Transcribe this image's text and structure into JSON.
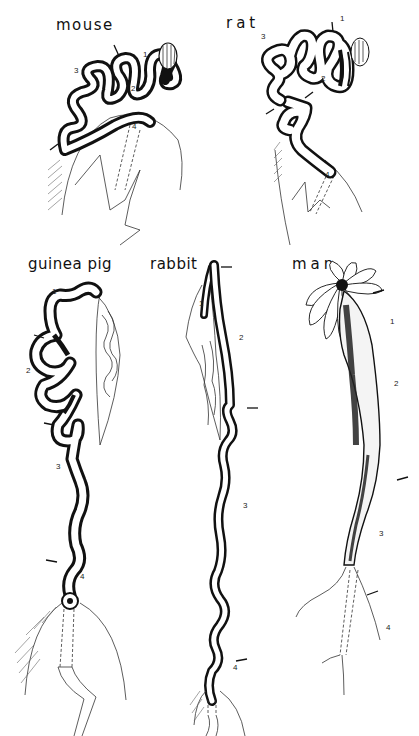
{
  "figure": {
    "panels": [
      {
        "id": "mouse",
        "title": "mouse",
        "segment_labels": [
          "1",
          "2",
          "3",
          "4"
        ]
      },
      {
        "id": "rat",
        "title": "rat",
        "segment_labels": [
          "1",
          "2",
          "3",
          "4"
        ]
      },
      {
        "id": "guinea-pig",
        "title": "guinea pig",
        "segment_labels": [
          "1",
          "2",
          "3",
          "4"
        ]
      },
      {
        "id": "rabbit",
        "title": "rabbit",
        "segment_labels": [
          "1",
          "2",
          "3",
          "4"
        ]
      },
      {
        "id": "man",
        "title": "man",
        "segment_labels": [
          "1",
          "2",
          "3",
          "4"
        ]
      }
    ]
  },
  "colors": {
    "ink": "#111111",
    "background": "#ffffff"
  }
}
